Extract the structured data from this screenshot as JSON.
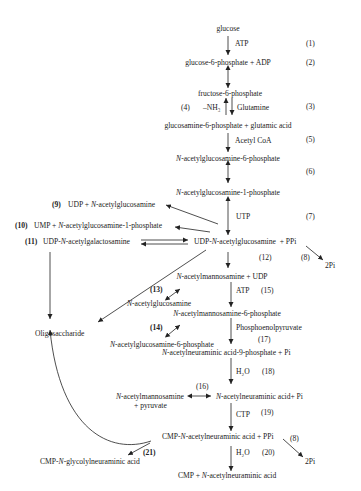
{
  "diagram": {
    "type": "metabolic-pathway",
    "nodes": {
      "glucose": "glucose",
      "atp1": "ATP",
      "g6p": "glucose-6-phosphate + ADP",
      "f6p": "fructose-6-phosphate",
      "nh3": "–NH₃",
      "glutamine": "Glutamine",
      "gln6p": "glucosamine-6-phosphate + glutamic acid",
      "acetylcoa": "Acetyl CoA",
      "glcnac6p_n": "N",
      "glcnac6p": "-acetylglucosamine-6-phosphate",
      "glcnac1p_n": "N",
      "glcnac1p": "-acetylglucosamine-1-phosphate",
      "utp": "UTP",
      "udp_glcnac_pre": "UDP-",
      "udp_glcnac_n": "N",
      "udp_glcnac": "-acetylglucosamine  + PPi",
      "pi2_a": "2Pi",
      "side9_pre": "UDP + ",
      "side9_n": "N",
      "side9": "-acetylglucosamine",
      "side10_pre": "UMP + ",
      "side10_n": "N",
      "side10": "-acetylglucosamine-1-phosphate",
      "side11_pre": "UDP-",
      "side11_n": "N",
      "side11": "-acetylgalactosamine",
      "oligo": "Oligosaccharide",
      "manac_n": "N",
      "manac": "-acetylmannosamine + UDP",
      "atp2": "ATP",
      "glcnac_n": "N",
      "glcnac": "-acetylglucosamine",
      "manac6p_n": "N",
      "manac6p": "-acetylmannosamine-6-phosphate",
      "pep": "Phosphoenolpyruvate",
      "glcnac6p_b_n": "N",
      "glcnac6p_b": "-acetylglucosamine-6-phosphate",
      "neu9p_n": "N",
      "neu9p": "-acetylneuraminic acid-9-phosphate + Pi",
      "h2o1": "H₂O",
      "manac_pyr_n": "N",
      "manac_pyr": "-acetylmannosamine",
      "pyruvate": "+ pyruvate",
      "neu_n": "N",
      "neu": "-acetylneuraminic acid+ Pi",
      "ctp": "CTP",
      "cmp_neu_pre": "CMP-",
      "cmp_neu_n": "N",
      "cmp_neu": "-acetylneuraminic acid + PPi",
      "pi2_b": "2Pi",
      "h2o2": "H₂O",
      "cmp_free_pre": "CMP + ",
      "cmp_free_n": "N",
      "cmp_free": "-acetylneuraminic acid",
      "cmp_glyc_pre": "CMP-",
      "cmp_glyc_n": "N",
      "cmp_glyc": "-glycolylneuraminic acid"
    },
    "step_labels": {
      "s1": "(1)",
      "s2": "(2)",
      "s3": "(3)",
      "s4": "(4)",
      "s5": "(5)",
      "s6": "(6)",
      "s7": "(7)",
      "s8a": "(8)",
      "s8b": "(8)",
      "s9": "(9)",
      "s10": "(10)",
      "s11": "(11)",
      "s12": "(12)",
      "s13": "(13)",
      "s14": "(14)",
      "s15": "(15)",
      "s16": "(16)",
      "s17": "(17)",
      "s18": "(18)",
      "s19": "(19)",
      "s20": "(20)",
      "s21": "(21)"
    }
  }
}
